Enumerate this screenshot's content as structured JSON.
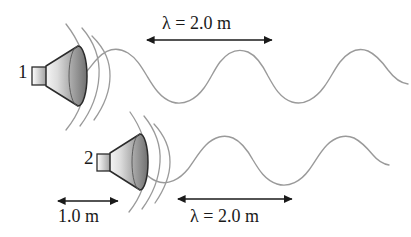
{
  "figure": {
    "background_color": "#ffffff",
    "width": 411,
    "height": 237
  },
  "labels": {
    "speaker_1": "1",
    "speaker_2": "2",
    "lambda_top": "λ = 2.0 m",
    "lambda_bottom": "λ = 2.0 m",
    "separation": "1.0 m"
  },
  "speakers": [
    {
      "id": "speaker-1",
      "label": "1",
      "cone_apex_x": 46,
      "cone_face_x": 78,
      "center_y": 76,
      "face_half_height": 30,
      "magnet_width": 14,
      "magnet_half_height": 9,
      "wavefront_arcs": 3,
      "color_outline": "#2b2b2b",
      "color_fill_light": "#f2f2f2",
      "color_fill_dark": "#8a8a8a"
    },
    {
      "id": "speaker-2",
      "label": "2",
      "cone_apex_x": 110,
      "cone_face_x": 140,
      "center_y": 162,
      "face_half_height": 28,
      "magnet_width": 13,
      "magnet_half_height": 8,
      "wavefront_arcs": 3,
      "color_outline": "#2b2b2b",
      "color_fill_light": "#f2f2f2",
      "color_fill_dark": "#8a8a8a"
    }
  ],
  "waves": [
    {
      "id": "wave-1",
      "source_speaker": "speaker-1",
      "start_x": 78,
      "end_x": 408,
      "baseline_y": 76,
      "amplitude": 26,
      "wavelength_px": 126,
      "phase_deg": 0,
      "color": "#9a9a9a",
      "stroke_width": 1.4
    },
    {
      "id": "wave-2",
      "source_speaker": "speaker-2",
      "start_x": 138,
      "end_x": 408,
      "baseline_y": 162,
      "amplitude": 24,
      "wavelength_px": 126,
      "phase_deg": 0,
      "color": "#9a9a9a",
      "stroke_width": 1.4
    }
  ],
  "dimension_arrows": [
    {
      "id": "arrow-lambda-top",
      "label": "λ = 2.0 m",
      "x_start": 147,
      "x_end": 272,
      "y": 40,
      "length_m": 2.0,
      "label_position": "above",
      "color": "#1a1a1a"
    },
    {
      "id": "arrow-separation",
      "label": "1.0 m",
      "x_start": 58,
      "x_end": 118,
      "y": 201,
      "length_m": 1.0,
      "label_position": "below",
      "color": "#1a1a1a"
    },
    {
      "id": "arrow-lambda-bottom",
      "label": "λ = 2.0 m",
      "x_start": 178,
      "x_end": 292,
      "y": 199,
      "length_m": 2.0,
      "label_position": "below",
      "color": "#1a1a1a"
    }
  ]
}
